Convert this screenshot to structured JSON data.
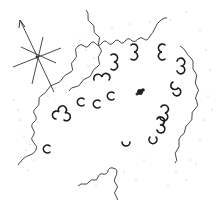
{
  "diagram": {
    "type": "archaeological-site-plan",
    "colors": {
      "line": "#333333",
      "stone": "#1a1a1a",
      "stipple": "#9a9a9a",
      "background": "#ffffff"
    },
    "north_arrow": {
      "center": [
        37,
        57
      ],
      "direction": "north-north-west"
    },
    "central_feature": {
      "shape": "hearth-blob",
      "center": [
        140,
        92
      ]
    },
    "stones": [
      {
        "shape": "cloverleaf",
        "x": 114,
        "y": 62
      },
      {
        "shape": "cloverleaf",
        "x": 134,
        "y": 52
      },
      {
        "shape": "cloverleaf",
        "x": 162,
        "y": 52
      },
      {
        "shape": "cloverleaf",
        "x": 182,
        "y": 66
      },
      {
        "shape": "cloverleaf",
        "x": 178,
        "y": 88
      },
      {
        "shape": "cloverleaf",
        "x": 102,
        "y": 78
      },
      {
        "shape": "cloverleaf",
        "x": 62,
        "y": 115
      },
      {
        "shape": "horseshoe",
        "x": 80,
        "y": 102
      },
      {
        "shape": "horseshoe",
        "x": 96,
        "y": 104
      },
      {
        "shape": "horseshoe",
        "x": 110,
        "y": 96
      },
      {
        "shape": "cloverleaf",
        "x": 165,
        "y": 113
      },
      {
        "shape": "cloverleaf",
        "x": 160,
        "y": 125
      },
      {
        "shape": "horseshoe",
        "x": 153,
        "y": 141
      },
      {
        "shape": "horseshoe",
        "x": 126,
        "y": 146
      },
      {
        "shape": "horseshoe",
        "x": 46,
        "y": 149
      }
    ]
  }
}
